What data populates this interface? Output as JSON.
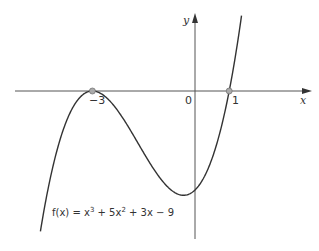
{
  "chart_data": {
    "type": "line",
    "title": "",
    "function": "f(x) = x^3 + 5x^2 + 3x - 9",
    "equation_label": {
      "prefix": "f(x) = x",
      "sup1": "3",
      "mid": " + 5x",
      "sup2": "2",
      "suffix": " + 3x − 9"
    },
    "xlabel": "x",
    "ylabel": "y",
    "x_tick_labels": [
      "−3",
      "0",
      "1"
    ],
    "x_ticks": [
      -3,
      0,
      1
    ],
    "roots": [
      {
        "x": -3,
        "y": 0,
        "note": "double root (touches axis)"
      },
      {
        "x": 1,
        "y": 0
      }
    ],
    "y_intercept": -9,
    "xlim": [
      -5.6,
      2.2
    ],
    "ylim": [
      -13.5,
      7.0
    ],
    "grid": false,
    "legend": null,
    "colors": {
      "curve": "#333333",
      "axes": "#555555",
      "root_marker": "#9a9a9a"
    }
  }
}
